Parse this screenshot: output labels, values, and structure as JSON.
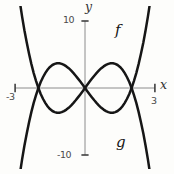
{
  "figure": {
    "colors": {
      "curve": "#161616",
      "axis": "#8c8c8c",
      "tick": "#3f3f3f",
      "tick_text": "#4a4a4a",
      "background": "#fdfdfb"
    }
  },
  "chart_data": {
    "type": "line",
    "title": "",
    "xlabel": "x",
    "ylabel": "y",
    "xlim": [
      -3,
      3
    ],
    "ylim": [
      -10,
      10
    ],
    "grid": false,
    "x_ticks": [
      {
        "value": -3,
        "label": "-3"
      },
      {
        "value": 3,
        "label": "3"
      }
    ],
    "y_ticks": [
      {
        "value": 10,
        "label": "10"
      },
      {
        "value": -10,
        "label": "-10"
      }
    ],
    "x": [
      -2.9,
      -2.8,
      -2.7,
      -2.6,
      -2.5,
      -2.4,
      -2.3,
      -2.2,
      -2.1,
      -2,
      -1.9,
      -1.8,
      -1.7,
      -1.6,
      -1.5,
      -1.4,
      -1.3,
      -1.2,
      -1.1,
      -1,
      -0.9,
      -0.8,
      -0.7,
      -0.6,
      -0.5,
      -0.4,
      -0.3,
      -0.2,
      -0.1,
      0,
      0.1,
      0.2,
      0.3,
      0.4,
      0.5,
      0.6,
      0.7,
      0.8,
      0.9,
      1,
      1.1,
      1.2,
      1.3,
      1.4,
      1.5,
      1.6,
      1.7,
      1.8,
      1.9,
      2,
      2.1,
      2.2,
      2.3,
      2.4,
      2.5,
      2.6,
      2.7,
      2.8,
      2.9
    ],
    "series": [
      {
        "name": "f",
        "label": "f",
        "label_position": "upper-right",
        "y": [
          -15.35,
          -12.9,
          -10.66,
          -8.61,
          -6.75,
          -5.07,
          -3.56,
          -2.22,
          -1.03,
          0,
          0.89,
          1.64,
          2.26,
          2.76,
          3.15,
          3.43,
          3.6,
          3.69,
          3.68,
          3.6,
          3.45,
          3.23,
          2.95,
          2.62,
          2.25,
          1.84,
          1.41,
          0.95,
          0.48,
          0,
          -0.48,
          -0.95,
          -1.41,
          -1.84,
          -2.25,
          -2.62,
          -2.95,
          -3.23,
          -3.45,
          -3.6,
          -3.68,
          -3.69,
          -3.6,
          -3.43,
          -3.15,
          -2.76,
          -2.26,
          -1.64,
          -0.89,
          0,
          1.03,
          2.22,
          3.56,
          5.07,
          6.75,
          8.61,
          10.66,
          12.9,
          15.35
        ]
      },
      {
        "name": "g",
        "label": "g",
        "label_position": "lower-right",
        "y": [
          15.35,
          12.9,
          10.66,
          8.61,
          6.75,
          5.07,
          3.56,
          2.22,
          1.03,
          0,
          -0.89,
          -1.64,
          -2.26,
          -2.76,
          -3.15,
          -3.43,
          -3.6,
          -3.69,
          -3.68,
          -3.6,
          -3.45,
          -3.23,
          -2.95,
          -2.62,
          -2.25,
          -1.84,
          -1.41,
          -0.95,
          -0.48,
          0,
          0.48,
          0.95,
          1.41,
          1.84,
          2.25,
          2.62,
          2.95,
          3.23,
          3.45,
          3.6,
          3.68,
          3.69,
          3.6,
          3.43,
          3.15,
          2.76,
          2.26,
          1.64,
          0.89,
          0,
          -1.03,
          -2.22,
          -3.56,
          -5.07,
          -6.75,
          -8.61,
          -10.66,
          -12.9,
          -15.35
        ]
      }
    ],
    "labels": {
      "y_axis": "y",
      "x_axis": "x",
      "f": "f",
      "g": "g",
      "tick_10": "10",
      "tick_neg10": "-10",
      "tick_3": "3",
      "tick_neg3": "-3"
    }
  }
}
